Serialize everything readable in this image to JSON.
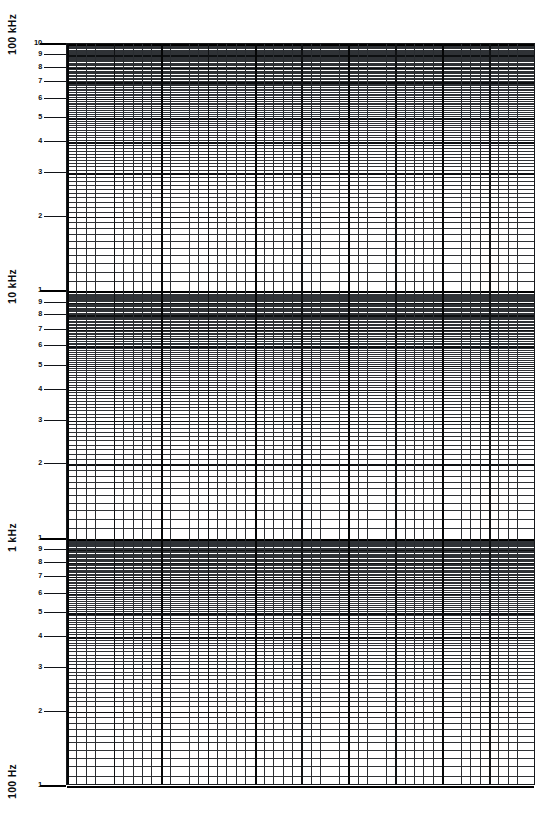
{
  "document": {
    "kind": "semi-log graph paper",
    "title": "Semi-logarithmic frequency grid",
    "background_color": "#ffffff",
    "grid_color": "#2f3236",
    "major_grid_color": "#0d0f11",
    "decade_line_color": "#000000"
  },
  "chart_data": {
    "type": "line",
    "title": "",
    "xlabel": "",
    "ylabel": "",
    "series": [],
    "grid": true,
    "legend": null,
    "x_axis": {
      "scale": "linear",
      "ticks": [],
      "minor_divisions": 50,
      "major_every": 5,
      "heavy_every": 10
    },
    "y_axis": {
      "scale": "log",
      "ylim": [
        100,
        100000
      ],
      "units": "Hz",
      "decades": 3,
      "decade_labels": [
        "100 kHz",
        "10 kHz",
        "1 kHz",
        "100 Hz"
      ],
      "decade_values": [
        100000,
        10000,
        1000,
        100
      ],
      "mantissa_ticks": [
        1,
        2,
        3,
        4,
        5,
        6,
        7,
        8,
        9
      ],
      "tick_labels_top_decade": [
        "10",
        "9",
        "8",
        "7",
        "6",
        "5",
        "4",
        "3",
        "2"
      ]
    }
  },
  "axis": {
    "decade_labels": [
      {
        "text": "100 kHz",
        "value": 100000
      },
      {
        "text": "10 kHz",
        "value": 10000
      },
      {
        "text": "1 kHz",
        "value": 1000
      },
      {
        "text": "100 Hz",
        "value": 100
      }
    ],
    "mantissa_labels": {
      "10": "10",
      "9": "9",
      "8": "8",
      "7": "7",
      "6": "6",
      "5": "5",
      "4": "4",
      "3": "3",
      "2": "2",
      "1": "1"
    }
  }
}
